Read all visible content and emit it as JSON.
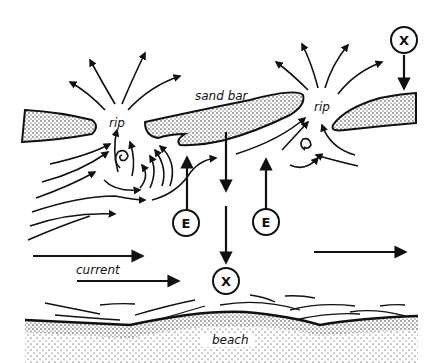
{
  "diagram": {
    "labels": {
      "sand_bar": "sand bar",
      "rip_left": "rip",
      "rip_right": "rip",
      "current": "current",
      "beach": "beach"
    },
    "markers": {
      "escape_left": "E",
      "escape_right": "E",
      "danger_center": "X",
      "danger_top_right": "X"
    },
    "colors": {
      "ink": "#111111",
      "background": "#ffffff"
    }
  }
}
